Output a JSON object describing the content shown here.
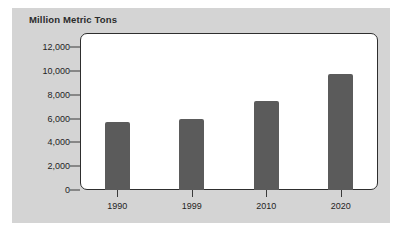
{
  "chart_data": {
    "type": "bar",
    "title": "Million Metric Tons",
    "xlabel": "",
    "ylabel": "Million Metric Tons",
    "categories": [
      "1990",
      "1999",
      "2010",
      "2020"
    ],
    "values": [
      5670,
      5920,
      7440,
      9700
    ],
    "ylim": [
      0,
      12000
    ],
    "ytick_values": [
      0,
      2000,
      4000,
      6000,
      8000,
      10000,
      12000
    ],
    "ytick_labels": [
      "0",
      "2,000",
      "4,000",
      "6,000",
      "8,000",
      "10,000",
      "12,000"
    ],
    "xtick_labels": [
      "1990",
      "1999",
      "2010",
      "2020"
    ],
    "grid": false,
    "legend": null,
    "series": [
      {
        "name": "Million Metric Tons",
        "values": [
          5670,
          5920,
          7440,
          9700
        ]
      }
    ],
    "colors": {
      "bar": "#5b5b5b",
      "panel_background": "#d4d4d4",
      "plot_background": "#ffffff",
      "axis_line": "#2e2e2e",
      "text": "#1f1f1f",
      "title_text": "#2b2b2b",
      "figure_background": "#ffffff"
    }
  }
}
